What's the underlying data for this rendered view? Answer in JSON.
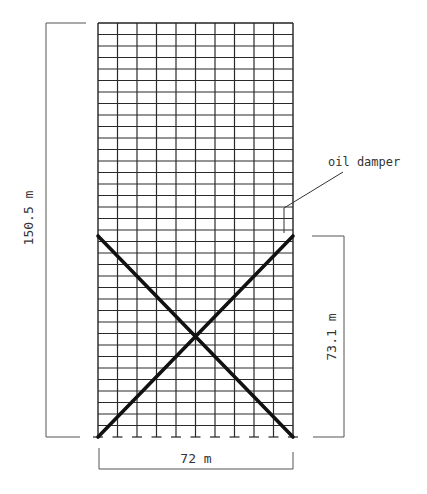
{
  "diagram": {
    "type": "building-frame-elevation",
    "frame": {
      "bays": 10,
      "stories": 36,
      "left_px": 98,
      "right_px": 293,
      "top_px": 23,
      "bottom_px": 437
    },
    "braces": {
      "description": "X-bracing with oil dampers over lower half of frame",
      "top_px": 236
    },
    "labels": {
      "height_total": "150.5 m",
      "height_damper_zone": "73.1 m",
      "width": "72 m",
      "annotation": "oil damper"
    },
    "colors": {
      "grid": "#2a2a2a",
      "brace": "#111111",
      "dimension": "#555555",
      "text": "#333333",
      "background": "#ffffff"
    }
  }
}
